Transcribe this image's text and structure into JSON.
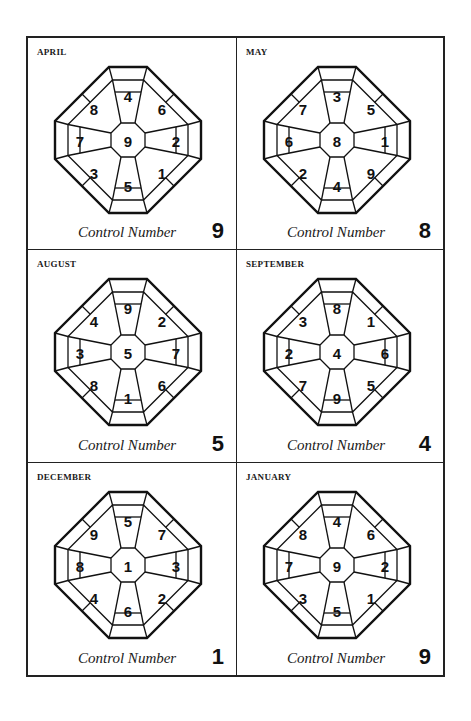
{
  "caption": "Control Number",
  "panels": [
    {
      "month": "APRIL",
      "control_number": "9",
      "cells": {
        "center": "9",
        "n": "4",
        "ne": "6",
        "e": "2",
        "se": "1",
        "s": "5",
        "sw": "3",
        "w": "7",
        "nw": "8"
      }
    },
    {
      "month": "MAY",
      "control_number": "8",
      "cells": {
        "center": "8",
        "n": "3",
        "ne": "5",
        "e": "1",
        "se": "9",
        "s": "4",
        "sw": "2",
        "w": "6",
        "nw": "7"
      }
    },
    {
      "month": "AUGUST",
      "control_number": "5",
      "cells": {
        "center": "5",
        "n": "9",
        "ne": "2",
        "e": "7",
        "se": "6",
        "s": "1",
        "sw": "8",
        "w": "3",
        "nw": "4"
      }
    },
    {
      "month": "SEPTEMBER",
      "control_number": "4",
      "cells": {
        "center": "4",
        "n": "8",
        "ne": "1",
        "e": "6",
        "se": "5",
        "s": "9",
        "sw": "7",
        "w": "2",
        "nw": "3"
      }
    },
    {
      "month": "DECEMBER",
      "control_number": "1",
      "cells": {
        "center": "1",
        "n": "5",
        "ne": "7",
        "e": "3",
        "se": "2",
        "s": "6",
        "sw": "4",
        "w": "8",
        "nw": "9"
      }
    },
    {
      "month": "JANUARY",
      "control_number": "9",
      "cells": {
        "center": "9",
        "n": "4",
        "ne": "6",
        "e": "2",
        "se": "1",
        "s": "5",
        "sw": "3",
        "w": "7",
        "nw": "8"
      }
    }
  ]
}
